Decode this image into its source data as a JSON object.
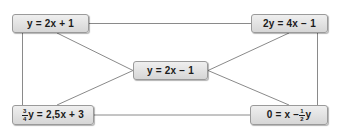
{
  "diagram": {
    "type": "equation-equivalence-graph",
    "background_color": "#ffffff",
    "node_fill_color": "#e4e4e4",
    "node_border_color": "#9a9a9a",
    "edge_color": "#8a8a8a",
    "text_color": "#1b1b1b",
    "nodes": [
      {
        "id": "top-left",
        "label": "y = 2x + 1",
        "parts": [
          {
            "kind": "text",
            "text": "y = 2x + 1"
          }
        ]
      },
      {
        "id": "top-right",
        "label": "2y = 4x − 1",
        "parts": [
          {
            "kind": "text",
            "text": "2y = 4x − 1"
          }
        ]
      },
      {
        "id": "center",
        "label": "y = 2x − 1",
        "parts": [
          {
            "kind": "text",
            "text": "y = 2x − 1"
          }
        ]
      },
      {
        "id": "bottom-left",
        "label": "¾ y = 2,5x + 3",
        "parts": [
          {
            "kind": "fraction",
            "numerator": "3",
            "denominator": "4"
          },
          {
            "kind": "text",
            "text": "y = 2,5x + 3"
          }
        ]
      },
      {
        "id": "bottom-right",
        "label": "0 = x − ½ y",
        "parts": [
          {
            "kind": "text",
            "text": "0 = x − "
          },
          {
            "kind": "fraction",
            "numerator": "1",
            "denominator": "2"
          },
          {
            "kind": "text",
            "text": "y"
          }
        ]
      }
    ],
    "edges": [
      {
        "from": "top-left",
        "to": "top-right",
        "style": "horizontal-top"
      },
      {
        "from": "top-left",
        "to": "bottom-left",
        "style": "vertical-left"
      },
      {
        "from": "top-right",
        "to": "bottom-right",
        "style": "vertical-right"
      },
      {
        "from": "bottom-left",
        "to": "bottom-right",
        "style": "horizontal-bottom"
      },
      {
        "from": "top-left",
        "to": "center",
        "style": "diagonal"
      },
      {
        "from": "top-right",
        "to": "center",
        "style": "diagonal"
      },
      {
        "from": "bottom-left",
        "to": "center",
        "style": "diagonal"
      },
      {
        "from": "bottom-right",
        "to": "center",
        "style": "diagonal"
      }
    ]
  }
}
